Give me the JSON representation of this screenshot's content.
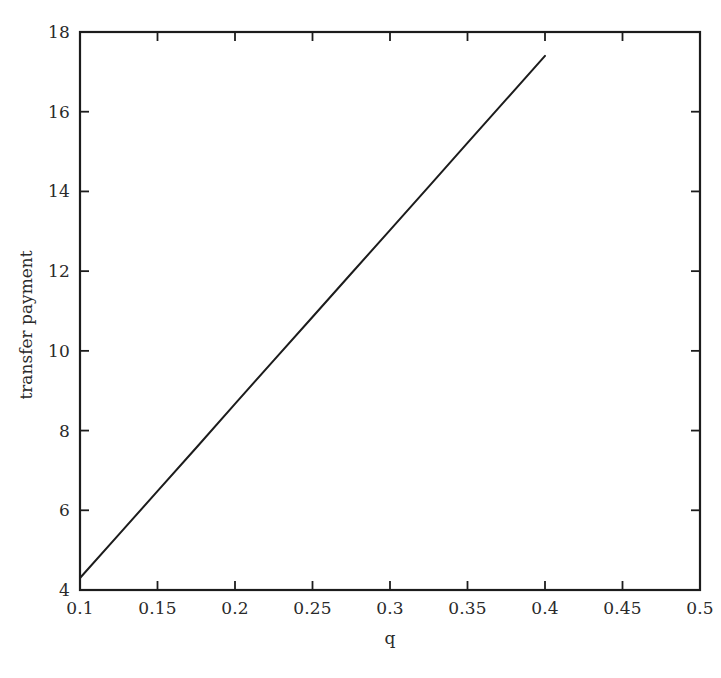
{
  "chart_data": {
    "type": "line",
    "title": "",
    "xlabel": "q",
    "ylabel": "transfer payment",
    "xlim": [
      0.1,
      0.5
    ],
    "ylim": [
      4,
      18
    ],
    "grid": false,
    "legend": false,
    "xticks": [
      "0.1",
      "0.15",
      "0.2",
      "0.25",
      "0.3",
      "0.35",
      "0.4",
      "0.45",
      "0.5"
    ],
    "xtick_values": [
      0.1,
      0.15,
      0.2,
      0.25,
      0.3,
      0.35,
      0.4,
      0.45,
      0.5
    ],
    "yticks": [
      "4",
      "6",
      "8",
      "10",
      "12",
      "14",
      "16",
      "18"
    ],
    "ytick_values": [
      4,
      6,
      8,
      10,
      12,
      14,
      16,
      18
    ],
    "series": [
      {
        "name": "transfer payment",
        "color": "#1c1c1c",
        "x": [
          0.1,
          0.125,
          0.15,
          0.175,
          0.2,
          0.225,
          0.25,
          0.275,
          0.3,
          0.325,
          0.35,
          0.375,
          0.4
        ],
        "values": [
          4.3,
          5.39,
          6.48,
          7.57,
          8.67,
          9.76,
          10.85,
          11.94,
          13.03,
          14.12,
          15.22,
          16.31,
          17.4
        ]
      }
    ],
    "line_endpoints": {
      "start": {
        "x": 0.1,
        "y": 4.3
      },
      "end": {
        "x": 0.4,
        "y": 17.4
      }
    },
    "axes_style": {
      "frame": "box",
      "tick_direction": "in",
      "ticks_all_sides": true,
      "axis_color": "#1c1c1c"
    }
  },
  "axis": {
    "xlabel": "q",
    "ylabel": "transfer payment"
  }
}
